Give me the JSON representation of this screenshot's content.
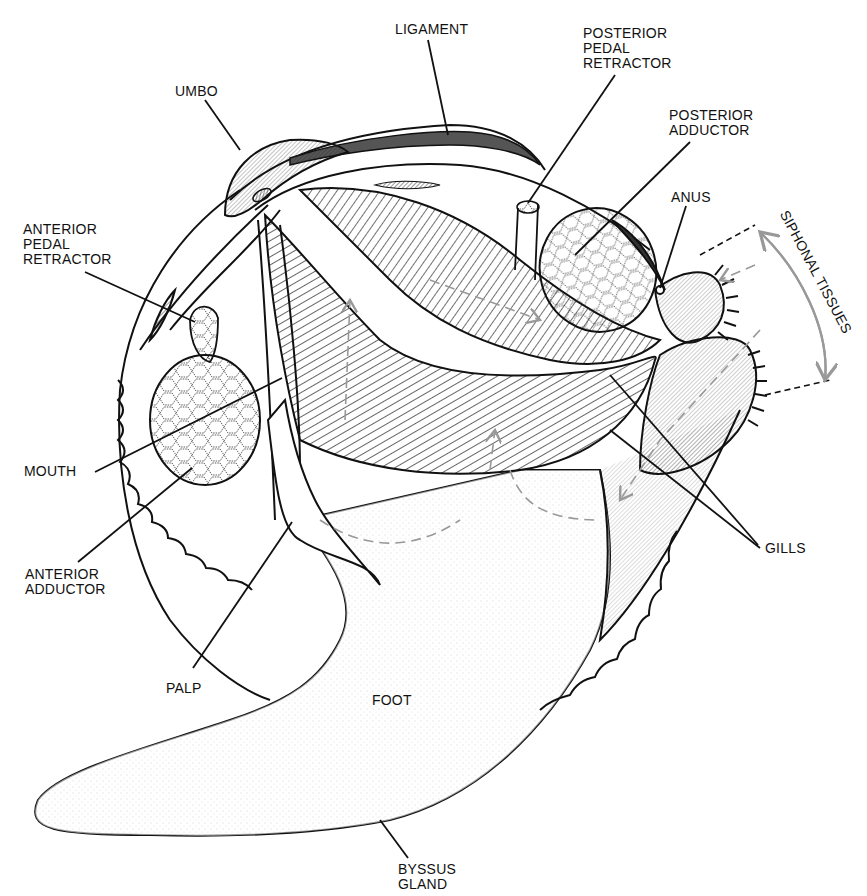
{
  "diagram": {
    "colors": {
      "ink": "#111111",
      "ligament": "#555555",
      "flow_arrow": "#999999",
      "background": "#ffffff"
    },
    "labels": {
      "ligament": "LIGAMENT",
      "umbo": "UMBO",
      "posterior_pedal_retractor": "POSTERIOR\nPEDAL\nRETRACTOR",
      "posterior_adductor": "POSTERIOR\nADDUCTOR",
      "anus": "ANUS",
      "siphonal_tissues": "SIPHONAL TISSUES",
      "anterior_pedal_retractor": "ANTERIOR\nPEDAL\nRETRACTOR",
      "mouth": "MOUTH",
      "anterior_adductor": "ANTERIOR\nADDUCTOR",
      "gills": "GILLS",
      "palp": "PALP",
      "foot": "FOOT",
      "byssus_gland": "BYSSUS\nGLAND"
    }
  }
}
